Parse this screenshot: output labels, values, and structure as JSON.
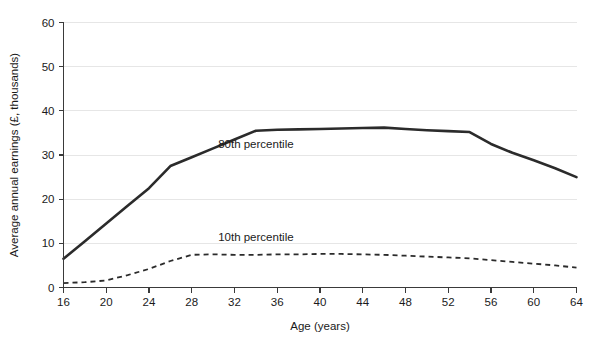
{
  "chart_data": {
    "type": "line",
    "title": "",
    "xlabel": "Age (years)",
    "ylabel": "Average annual earnings (£, thousands)",
    "xlim": [
      16,
      64
    ],
    "ylim": [
      0,
      60
    ],
    "xticks": [
      16,
      20,
      24,
      28,
      32,
      36,
      40,
      44,
      48,
      52,
      56,
      60,
      64
    ],
    "yticks": [
      0,
      10,
      20,
      30,
      40,
      50,
      60
    ],
    "grid": "horizontal",
    "legend_position": "inline-annotations",
    "x": [
      16,
      18,
      20,
      22,
      24,
      26,
      28,
      30,
      32,
      34,
      36,
      38,
      40,
      42,
      44,
      46,
      48,
      50,
      52,
      54,
      56,
      58,
      60,
      62,
      64
    ],
    "series": [
      {
        "name": "80th percentile",
        "style": "solid",
        "color": "#2b2b2b",
        "label_x": 34,
        "label_y": 31.5,
        "values": [
          6.5,
          10.5,
          14.5,
          18.5,
          22.5,
          27.5,
          29.5,
          31.5,
          33.5,
          35.5,
          35.7,
          35.8,
          35.9,
          36.0,
          36.1,
          36.2,
          35.9,
          35.6,
          35.4,
          35.2,
          32.5,
          30.5,
          28.8,
          27.0,
          25.0
        ]
      },
      {
        "name": "10th percentile",
        "style": "dashed",
        "color": "#2b2b2b",
        "label_x": 34,
        "label_y": 10.5,
        "values": [
          1.0,
          1.2,
          1.6,
          2.8,
          4.2,
          6.0,
          7.4,
          7.5,
          7.4,
          7.4,
          7.5,
          7.5,
          7.6,
          7.6,
          7.5,
          7.4,
          7.2,
          7.0,
          6.8,
          6.6,
          6.2,
          5.8,
          5.4,
          5.0,
          4.5
        ]
      }
    ]
  },
  "axes": {
    "x_tick_labels": [
      "16",
      "20",
      "24",
      "28",
      "32",
      "36",
      "40",
      "44",
      "48",
      "52",
      "56",
      "60",
      "64"
    ],
    "y_tick_labels": [
      "0",
      "10",
      "20",
      "30",
      "40",
      "50",
      "60"
    ],
    "x_axis_title": "Age (years)",
    "y_axis_title": "Average annual earnings (£, thousands)"
  },
  "annotations": {
    "upper_series_label": "80th percentile",
    "lower_series_label": "10th percentile"
  },
  "colors": {
    "line": "#2b2b2b",
    "gridline": "#e6e6e6",
    "axis": "#3a3a3a",
    "background": "#ffffff"
  }
}
